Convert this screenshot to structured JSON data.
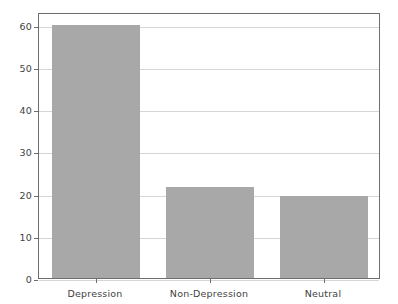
{
  "chart_data": {
    "type": "bar",
    "title": "",
    "xlabel": "",
    "ylabel": "",
    "categories": [
      "Depression",
      "Non-Depression",
      "Neutral"
    ],
    "values": [
      60,
      21.5,
      19.5
    ],
    "ylim": [
      0,
      63
    ],
    "yticks": [
      0,
      10,
      20,
      30,
      40,
      50,
      60
    ],
    "ytick_labels": [
      "0",
      "10",
      "20",
      "30",
      "40",
      "50",
      "60"
    ],
    "grid": true,
    "legend": "none",
    "bar_color": "#a8a8a8",
    "grid_color": "#d6d6d6",
    "frame_color": "#6e6e6e",
    "background_color": "#ffffff",
    "tick_label_color": "#3f3f3f"
  }
}
